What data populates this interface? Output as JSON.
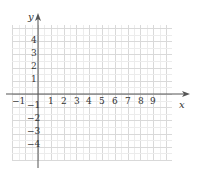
{
  "diagram": {
    "type": "coordinate-grid",
    "x_axis": {
      "label": "x",
      "tick_labels": [
        "-1",
        "1",
        "2",
        "3",
        "4",
        "5",
        "6",
        "7",
        "8",
        "9"
      ],
      "range": [
        -2,
        10.5
      ]
    },
    "y_axis": {
      "label": "y",
      "tick_labels": [
        "4",
        "3",
        "2",
        "1",
        "-1",
        "-2",
        "-3",
        "-4"
      ],
      "range": [
        -5,
        5
      ]
    },
    "grid": {
      "major_step": 1,
      "minor_step": 0.5
    },
    "colors": {
      "axis": "#555555",
      "grid_major": "#d9d9d9",
      "grid_minor": "#ececec",
      "text": "#333333"
    }
  },
  "labels": {
    "x": "x",
    "y": "y",
    "xm1": "−1",
    "x1": "1",
    "x2": "2",
    "x3": "3",
    "x4": "4",
    "x5": "5",
    "x6": "6",
    "x7": "7",
    "x8": "8",
    "x9": "9",
    "y4": "4",
    "y3": "3",
    "y2": "2",
    "y1": "1",
    "ym1": "−1",
    "ym2": "−2",
    "ym3": "−3",
    "ym4": "−4"
  }
}
